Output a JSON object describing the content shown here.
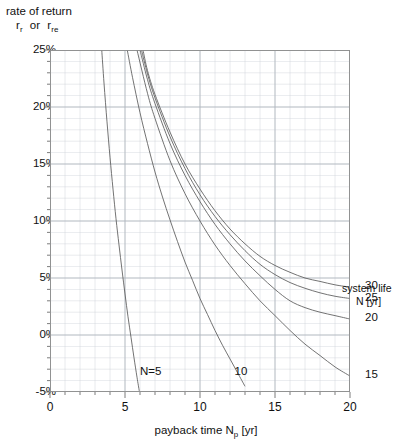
{
  "chart_data": {
    "type": "line",
    "title": "",
    "ylabel_lines": [
      "rate of return",
      "r_r  or  r_re"
    ],
    "ylabel_main": "rate of return",
    "ylabel_sym1_base": "r",
    "ylabel_sym1_sub": "r",
    "ylabel_or": "or",
    "ylabel_sym2_base": "r",
    "ylabel_sym2_sub": "re",
    "xlabel_base": "payback time N",
    "xlabel_sub": "p",
    "xlabel_unit": "[yr]",
    "xlim": [
      0,
      20
    ],
    "ylim": [
      -5,
      25
    ],
    "xticks": [
      0,
      5,
      10,
      15,
      20
    ],
    "xtick_labels": [
      "0",
      "5",
      "10",
      "15",
      "20"
    ],
    "yticks": [
      -5,
      0,
      5,
      10,
      15,
      20,
      25
    ],
    "ytick_labels": [
      "-5%",
      "0%",
      "5%",
      "10%",
      "15%",
      "20%",
      "25%"
    ],
    "x_minor_step": 1,
    "y_minor_step": 1,
    "grid": true,
    "grid_color": "#c9cfd6",
    "frame_color": "#8d8d8d",
    "curve_color": "#5a5a5a",
    "legend_position": "right",
    "legend_title_line1": "system life",
    "legend_title_line2": "N [yr]",
    "legend_entries": [
      {
        "label": "30",
        "y_at_x20": 4.2
      },
      {
        "label": "25",
        "y_at_x20": 3.2
      },
      {
        "label": "20",
        "y_at_x20": 1.4
      },
      {
        "label": "15",
        "y_at_x20": -3.6
      }
    ],
    "inplot_annotations": [
      {
        "text": "N=5",
        "x": 6.0,
        "y": -3.3
      },
      {
        "text": "10",
        "x": 12.3,
        "y": -3.3
      }
    ],
    "series": [
      {
        "name": "N=5",
        "system_life": 5,
        "x": [
          3.45,
          3.6,
          3.8,
          4.0,
          4.2,
          4.4,
          4.6,
          4.8,
          5.0,
          5.2,
          5.4,
          5.6,
          5.8,
          5.95
        ],
        "y": [
          25.0,
          22.1,
          18.7,
          15.6,
          12.8,
          10.2,
          7.9,
          5.7,
          3.6,
          1.6,
          -0.2,
          -2.0,
          -3.7,
          -4.9
        ]
      },
      {
        "name": "N=10",
        "system_life": 10,
        "x": [
          5.15,
          5.5,
          6.0,
          6.5,
          7.0,
          7.5,
          8.0,
          8.5,
          9.0,
          9.5,
          10.0,
          10.5,
          11.0,
          11.5,
          12.0,
          12.5,
          13.0
        ],
        "y": [
          25.0,
          22.6,
          19.5,
          16.8,
          14.3,
          12.1,
          10.1,
          8.2,
          6.4,
          4.8,
          3.2,
          1.8,
          0.4,
          -0.9,
          -2.1,
          -3.3,
          -4.5
        ]
      },
      {
        "name": "N=15",
        "system_life": 15,
        "x": [
          5.8,
          6.5,
          7.0,
          8.0,
          9.0,
          10.0,
          11.0,
          12.0,
          13.0,
          14.0,
          15.0,
          16.0,
          17.0,
          18.0,
          19.0,
          20.0
        ],
        "y": [
          25.0,
          21.2,
          19.0,
          15.3,
          12.4,
          10.0,
          7.9,
          6.1,
          4.5,
          3.0,
          1.7,
          0.4,
          -0.8,
          -1.8,
          -2.8,
          -3.6
        ]
      },
      {
        "name": "N=20",
        "system_life": 20,
        "x": [
          6.0,
          6.5,
          7.0,
          8.0,
          9.0,
          10.0,
          11.0,
          12.0,
          13.0,
          14.0,
          15.0,
          16.0,
          17.0,
          18.0,
          19.0,
          20.0
        ],
        "y": [
          25.0,
          22.4,
          20.3,
          16.8,
          14.0,
          11.7,
          9.7,
          8.0,
          6.5,
          5.2,
          4.0,
          3.0,
          2.4,
          2.0,
          1.7,
          1.4
        ]
      },
      {
        "name": "N=25",
        "system_life": 25,
        "x": [
          6.1,
          6.5,
          7.0,
          8.0,
          9.0,
          10.0,
          11.0,
          12.0,
          13.0,
          14.0,
          15.0,
          16.0,
          17.0,
          18.0,
          19.0,
          20.0
        ],
        "y": [
          25.0,
          22.9,
          20.8,
          17.4,
          14.6,
          12.3,
          10.4,
          8.8,
          7.4,
          6.2,
          5.3,
          4.6,
          4.1,
          3.7,
          3.4,
          3.2
        ]
      },
      {
        "name": "N=30",
        "system_life": 30,
        "x": [
          6.2,
          6.5,
          7.0,
          8.0,
          9.0,
          10.0,
          11.0,
          12.0,
          13.0,
          14.0,
          15.0,
          16.0,
          17.0,
          18.0,
          19.0,
          20.0
        ],
        "y": [
          25.0,
          23.2,
          21.1,
          17.8,
          15.0,
          12.8,
          10.9,
          9.3,
          8.0,
          6.9,
          6.1,
          5.5,
          5.0,
          4.7,
          4.4,
          4.2
        ]
      }
    ]
  }
}
